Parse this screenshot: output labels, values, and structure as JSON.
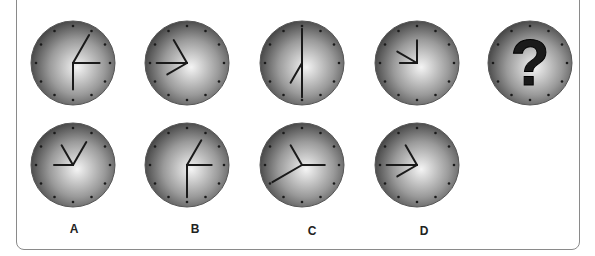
{
  "puzzle": {
    "sequence": [
      {
        "hands_deg": [
          30,
          90,
          180
        ],
        "lengths": [
          0.85,
          0.7,
          0.7
        ]
      },
      {
        "hands_deg": [
          330,
          270,
          240
        ],
        "lengths": [
          0.7,
          0.8,
          0.6
        ]
      },
      {
        "hands_deg": [
          0,
          210,
          180
        ],
        "lengths": [
          0.9,
          0.6,
          0.9
        ]
      },
      {
        "hands_deg": [
          0,
          300,
          270
        ],
        "lengths": [
          0.6,
          0.6,
          0.45
        ]
      },
      {
        "question_mark": "?"
      }
    ],
    "options": [
      {
        "label": "A",
        "hands_deg": [
          330,
          30,
          270
        ],
        "lengths": [
          0.6,
          0.7,
          0.5
        ]
      },
      {
        "label": "B",
        "hands_deg": [
          30,
          90,
          180
        ],
        "lengths": [
          0.75,
          0.65,
          0.85
        ]
      },
      {
        "label": "C",
        "hands_deg": [
          330,
          90,
          240
        ],
        "lengths": [
          0.6,
          0.6,
          0.9
        ]
      },
      {
        "label": "D",
        "hands_deg": [
          330,
          270,
          240
        ],
        "lengths": [
          0.6,
          0.8,
          0.6
        ]
      }
    ]
  },
  "colors": {
    "face_center": "#f4f4f4",
    "face_edge": "#3a3a3a",
    "hand": "#1a1a1a",
    "tick": "#1a1a1a",
    "border": "#8a8a8a"
  }
}
